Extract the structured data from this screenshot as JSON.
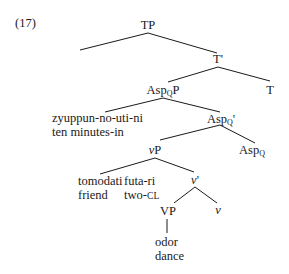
{
  "example_number": "(17)",
  "tree": {
    "TP": {
      "label": "TP"
    },
    "T_bar": {
      "label": "T'"
    },
    "T": {
      "label": "T"
    },
    "AspP": {
      "base": "Asp",
      "sub": "Q",
      "suffix": "P"
    },
    "Asp_bar": {
      "base": "Asp",
      "sub": "Q",
      "suffix": "'"
    },
    "Asp": {
      "base": "Asp",
      "sub": "Q"
    },
    "adjunct": {
      "gloss_line1": "zyuppun-no-uti-ni",
      "gloss_line2": "ten minutes-in"
    },
    "vP": {
      "italic": "v",
      "suffix": "P"
    },
    "v_bar": {
      "italic": "v",
      "suffix": "'"
    },
    "v": {
      "italic": "v"
    },
    "VP": {
      "label": "VP"
    },
    "subject_noun": {
      "line1": "tomodati",
      "line2": "friend"
    },
    "subject_classifier": {
      "line1": "futa-ri",
      "line2_main": "two-",
      "line2_sc": "CL"
    },
    "verb": {
      "line1": "odor",
      "line2": "dance"
    }
  }
}
